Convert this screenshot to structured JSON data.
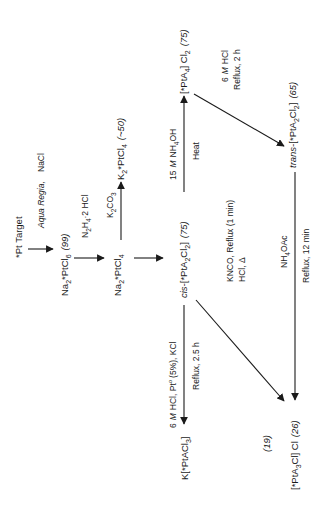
{
  "diagram": {
    "type": "reaction-scheme",
    "orientation": "rotated-90-ccw",
    "background_color": "#ffffff",
    "ink_color": "#1a1a1a",
    "nodes": [
      {
        "id": "pt_target",
        "label": "*Pt Target"
      },
      {
        "id": "na2ptcl6",
        "formula": "Na2*PtCl6",
        "yield": "(99)"
      },
      {
        "id": "na2ptcl4",
        "formula": "Na2*PtCl4"
      },
      {
        "id": "k2ptcl4",
        "formula": "K2*PtCl4",
        "yield": "(~50)"
      },
      {
        "id": "cis",
        "prefix": "cis-",
        "formula": "[*PtA2Cl2]",
        "yield": "(75)"
      },
      {
        "id": "pta4",
        "formula": "[*PtA4]Cl2",
        "yield": "(75)"
      },
      {
        "id": "trans",
        "prefix": "trans-",
        "formula": "[*PtA2Cl2]",
        "yield": "(65)"
      },
      {
        "id": "kptacl3",
        "formula": "K[*PtACl3]"
      },
      {
        "id": "pta3cl",
        "formula": "[*PtA3Cl]Cl",
        "yield": "(26)"
      },
      {
        "id": "yield19",
        "label": "(19)"
      }
    ],
    "reactions": [
      {
        "from": "pt_target",
        "to": "na2ptcl6",
        "reagents": "Aqua Regia, NaCl"
      },
      {
        "from": "na2ptcl6",
        "to": "na2ptcl4",
        "reagents": "N2H4·2 HCl"
      },
      {
        "from": "na2ptcl4",
        "to": "k2ptcl4",
        "reagents": "K2CO3"
      },
      {
        "from": "na2ptcl4",
        "to": "cis",
        "reagents": ""
      },
      {
        "from": "cis",
        "to": "pta4",
        "reagents": "15 M NH4OH",
        "conditions": "Heat"
      },
      {
        "from": "pta4",
        "to": "trans",
        "reagents": "6 M HCl",
        "conditions": "Reflux, 2 h"
      },
      {
        "from": "trans",
        "to": "pta3cl",
        "reagents": "NH4OAc",
        "conditions": "Reflux, 12 min"
      },
      {
        "from": "cis",
        "to": "pta3cl",
        "reagents": "KNCO, Reflux (1 min)",
        "conditions": "HCl, Δ"
      },
      {
        "from": "cis",
        "to": "kptacl3",
        "reagents": "6 M HCl, Pt° (5%), KCl",
        "conditions": "Reflux, 2.5 h"
      }
    ]
  },
  "text": {
    "pt_target": "*Pt Target",
    "aqua_regia": "Aqua Regia,",
    "nacl": "NaCl",
    "na2ptcl6_a": "Na",
    "na2ptcl6_b": "2",
    "na2ptcl6_c": "*PtCl",
    "na2ptcl6_d": "6",
    "y99": "(99)",
    "n2h4_a": "N",
    "n2h4_b": "2",
    "n2h4_c": "H",
    "n2h4_d": "4",
    "n2h4_e": "·2 HCl",
    "na2ptcl4_a": "Na",
    "na2ptcl4_b": "2",
    "na2ptcl4_c": "*PtCl",
    "na2ptcl4_d": "4",
    "k2co3_a": "K",
    "k2co3_b": "2",
    "k2co3_c": "CO",
    "k2co3_d": "3",
    "k2ptcl4_a": "K",
    "k2ptcl4_b": "2",
    "k2ptcl4_c": "*PtCl",
    "k2ptcl4_d": "4",
    "y50": "(~50)",
    "cis_prefix": "cis-",
    "cis_a": "[*PtA",
    "cis_b": "2",
    "cis_c": "Cl",
    "cis_d": "2",
    "cis_e": "]",
    "y75a": "(75)",
    "nh4oh_a": "15",
    "nh4oh_m": "M",
    "nh4oh_b": "NH",
    "nh4oh_c": "4",
    "nh4oh_d": "OH",
    "heat": "Heat",
    "pta4_a": "[*PtA",
    "pta4_b": "4",
    "pta4_c": "] Cl",
    "pta4_d": "2",
    "y75b": "(75)",
    "hcl6_a": "6",
    "hcl6_m": "M",
    "hcl6_b": "HCl",
    "reflux2h": "Reflux, 2 h",
    "trans_prefix": "trans-",
    "trans_a": "[*PtA",
    "trans_b": "2",
    "trans_c": "Cl",
    "trans_d": "2",
    "trans_e": "]",
    "y65": "(65)",
    "knco": "KNCO, Reflux (1 min)",
    "hcl_delta": "HCl, Δ",
    "nh4oac_a": "NH",
    "nh4oac_b": "4",
    "nh4oac_c": "OAc",
    "reflux12": "Reflux, 12 min",
    "hclpt_a": "6",
    "hclpt_m": "M",
    "hclpt_b": "HCl, Pt",
    "hclpt_c": "o",
    "hclpt_d": "(5%), KCl",
    "reflux25": "Reflux, 2.5 h",
    "kptacl3_a": "K[*PtACl",
    "kptacl3_b": "3",
    "kptacl3_c": "]",
    "y19": "(19)",
    "pta3cl_a": "[*PtA",
    "pta3cl_b": "3",
    "pta3cl_c": "Cl] Cl",
    "y26": "(26)"
  }
}
